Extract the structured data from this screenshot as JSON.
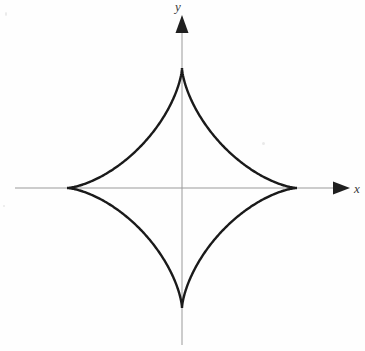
{
  "figure": {
    "background_color": "#fefefe",
    "width": 365,
    "height": 351
  },
  "axes": {
    "origin": {
      "x": 182,
      "y": 188
    },
    "color": "#9a9a9a",
    "stroke_width": 1,
    "x_axis": {
      "label": "x",
      "label_position": {
        "x": 357,
        "y": 192
      },
      "start": {
        "x": 15,
        "y": 188
      },
      "end": {
        "x": 345,
        "y": 188
      },
      "arrow": "right-arrowhead"
    },
    "y_axis": {
      "label": "y",
      "label_position": {
        "x": 178,
        "y": 11
      },
      "start": {
        "x": 182,
        "y": 345
      },
      "end": {
        "x": 182,
        "y": 18
      },
      "arrow": "up-arrowhead"
    }
  },
  "chart_data": {
    "type": "line",
    "subtitle": "",
    "curve_name": "astroid",
    "equation": "x^(2/3) + y^(2/3) = a^(2/3)",
    "parametric": "x = a cos^3(t), y = a sin^3(t)",
    "xlabel": "x",
    "ylabel": "y",
    "grid": false,
    "legend": "none",
    "xlim": [
      -1.25,
      1.45
    ],
    "ylim": [
      -1.45,
      1.5
    ],
    "center": [
      0,
      0
    ],
    "radius_x_px": 115,
    "radius_y_px": 120,
    "cusps": [
      {
        "name": "right-cusp",
        "x": 1,
        "y": 0,
        "px": 297,
        "py": 188
      },
      {
        "name": "top-cusp",
        "x": 0,
        "y": 1,
        "px": 182,
        "py": 68
      },
      {
        "name": "left-cusp",
        "x": -1,
        "y": 0,
        "px": 67,
        "py": 188
      },
      {
        "name": "bottom-cusp",
        "x": 0,
        "y": -1,
        "px": 182,
        "py": 308
      }
    ],
    "series": [
      {
        "name": "astroid",
        "color": "#1a1a1a",
        "stroke_width": 2.4,
        "closed": true,
        "points_t_degrees": [
          0,
          15,
          30,
          45,
          60,
          75,
          90,
          105,
          120,
          135,
          150,
          165,
          180,
          195,
          210,
          225,
          240,
          255,
          270,
          285,
          300,
          315,
          330,
          345,
          360
        ],
        "x": [
          1.0,
          0.901,
          0.65,
          0.354,
          0.125,
          0.017,
          0.0,
          -0.017,
          -0.125,
          -0.354,
          -0.65,
          -0.901,
          -1.0,
          -0.901,
          -0.65,
          -0.354,
          -0.125,
          -0.017,
          0.0,
          0.017,
          0.125,
          0.354,
          0.65,
          0.901,
          1.0
        ],
        "y": [
          0.0,
          0.017,
          0.125,
          0.354,
          0.65,
          0.901,
          1.0,
          0.901,
          0.65,
          0.354,
          0.125,
          0.017,
          0.0,
          -0.017,
          -0.125,
          -0.354,
          -0.65,
          -0.901,
          -1.0,
          -0.901,
          -0.65,
          -0.354,
          -0.125,
          -0.017,
          0.0
        ]
      }
    ]
  }
}
